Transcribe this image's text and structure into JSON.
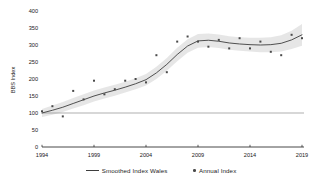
{
  "chart_data": {
    "type": "line",
    "ylabel": "BBS Index",
    "xlabel": "",
    "xlim": [
      1994,
      2019
    ],
    "ylim": [
      0,
      400
    ],
    "x_ticks": [
      1994,
      1999,
      2004,
      2009,
      2014,
      2019
    ],
    "y_ticks": [
      0,
      50,
      100,
      150,
      200,
      250,
      300,
      350,
      400
    ],
    "grid": "off",
    "legend_position": "bottom",
    "reference_line_y": 100,
    "x": [
      1994,
      1995,
      1996,
      1997,
      1998,
      1999,
      2000,
      2001,
      2002,
      2003,
      2004,
      2005,
      2006,
      2007,
      2008,
      2009,
      2010,
      2011,
      2012,
      2013,
      2014,
      2015,
      2016,
      2017,
      2018,
      2019
    ],
    "series": [
      {
        "name": "Smoothed Index Wales",
        "style": "line",
        "color": "#3d3d3d",
        "values": [
          100,
          108,
          117,
          128,
          139,
          150,
          159,
          167,
          176,
          186,
          198,
          218,
          243,
          272,
          297,
          312,
          314,
          311,
          306,
          303,
          301,
          300,
          301,
          305,
          315,
          330
        ]
      },
      {
        "name": "Annual Index",
        "style": "scatter",
        "color": "#4a4a4a",
        "values": [
          105,
          120,
          90,
          165,
          140,
          195,
          155,
          170,
          195,
          200,
          190,
          270,
          220,
          310,
          325,
          310,
          295,
          315,
          290,
          320,
          290,
          310,
          280,
          270,
          330,
          320
        ]
      }
    ],
    "confidence_band": {
      "color": "#e5e5e5",
      "lower": [
        88,
        95,
        103,
        113,
        123,
        134,
        143,
        151,
        160,
        170,
        181,
        200,
        224,
        252,
        277,
        292,
        294,
        291,
        286,
        283,
        281,
        279,
        279,
        281,
        288,
        298
      ],
      "upper": [
        112,
        122,
        132,
        144,
        155,
        166,
        175,
        183,
        192,
        202,
        215,
        236,
        262,
        292,
        317,
        332,
        334,
        331,
        326,
        323,
        321,
        321,
        323,
        329,
        342,
        362
      ]
    },
    "legend": [
      {
        "symbol": "line",
        "label": "Smoothed Index Wales"
      },
      {
        "symbol": "point",
        "label": "Annual Index"
      }
    ],
    "colors": {
      "axis": "#1a1a1a",
      "tick_text": "#1a1a1a",
      "reference_line": "#8c8c8c",
      "background": "#ffffff"
    }
  }
}
